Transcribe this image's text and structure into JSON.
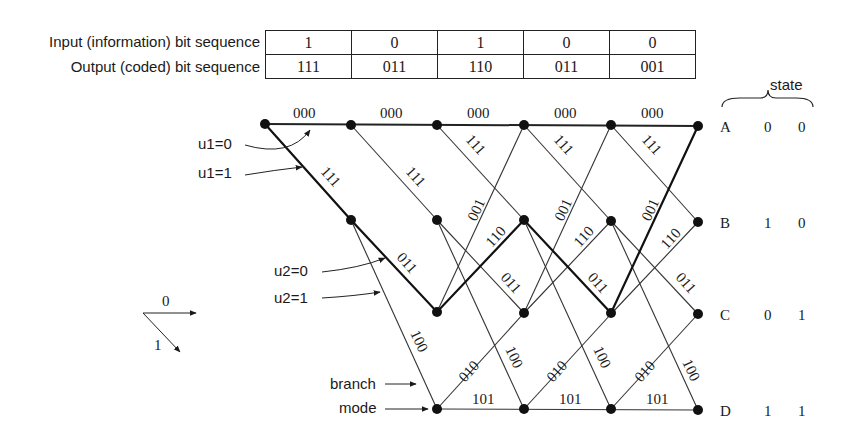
{
  "table": {
    "input_label": "Input (information) bit sequence",
    "output_label": "Output (coded) bit sequence",
    "input_bits": [
      "1",
      "0",
      "1",
      "0",
      "0"
    ],
    "output_bits": [
      "111",
      "011",
      "110",
      "011",
      "001"
    ]
  },
  "state_header": "state",
  "states": [
    {
      "name": "A",
      "b1": "0",
      "b2": "0"
    },
    {
      "name": "B",
      "b1": "1",
      "b2": "0"
    },
    {
      "name": "C",
      "b1": "0",
      "b2": "1"
    },
    {
      "name": "D",
      "b1": "1",
      "b2": "1"
    }
  ],
  "annotations": {
    "u1_0": "u1=0",
    "u1_1": "u1=1",
    "u2_0": "u2=0",
    "u2_1": "u2=1",
    "branch": "branch",
    "mode": "mode",
    "legend_0": "0",
    "legend_1": "1"
  },
  "branch_labels": {
    "AA": "000",
    "AB": "111",
    "BC": "011",
    "BD": "100",
    "CA": "001",
    "CB": "110",
    "DC": "010",
    "DD": "101"
  }
}
